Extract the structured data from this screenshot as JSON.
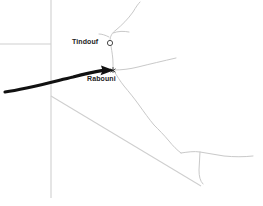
{
  "map": {
    "type": "locator-map",
    "background_color": "#ffffff",
    "places": [
      {
        "name": "Tindouf",
        "label": "Tindouf",
        "marker": "hollow-circle-marker",
        "marker_x": 110,
        "marker_y": 43,
        "label_x": 72,
        "label_y": 38
      },
      {
        "name": "Rabouni",
        "label": "Rabouni",
        "marker": "junction-dot-marker",
        "marker_x": 113,
        "marker_y": 70,
        "label_x": 87,
        "label_y": 75
      }
    ],
    "annotation": {
      "name": "direction-arrow",
      "shape": "curved-arrow",
      "color": "#111111",
      "points_to": "Rabouni",
      "from_x": 5,
      "from_y": 92,
      "to_x": 113,
      "to_y": 70
    },
    "colors": {
      "road": "#c9c9c9",
      "border": "#cfcfcf",
      "arrow": "#111111",
      "label_text": "#222222",
      "marker_stroke": "#555555"
    },
    "features": {
      "border_vertical_label": "vertical-border-line",
      "border_horizontal_label": "horizontal-border-line",
      "border_diagonal_label": "diagonal-border-line",
      "road_network_label": "road-network"
    }
  }
}
